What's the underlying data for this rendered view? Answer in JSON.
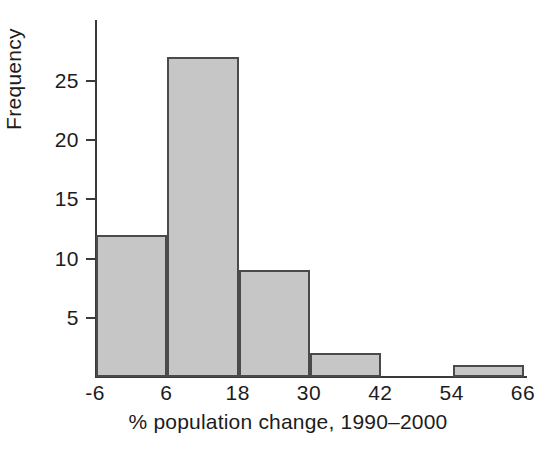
{
  "chart_data": {
    "type": "bar",
    "title": "",
    "subtitle": "",
    "xlabel": "% population change, 1990–2000",
    "ylabel": "Frequency",
    "grid": false,
    "legend": null,
    "xlim": [
      -6,
      66
    ],
    "ylim": [
      0,
      28
    ],
    "bin_width": 12,
    "x_tick_labels": [
      "-6",
      "6",
      "18",
      "30",
      "42",
      "54",
      "66"
    ],
    "x_tick_values": [
      -6,
      6,
      18,
      30,
      42,
      54,
      66
    ],
    "y_tick_labels": [
      "5",
      "10",
      "15",
      "20",
      "25"
    ],
    "y_tick_values": [
      5,
      10,
      15,
      20,
      25
    ],
    "categories": [
      "-6 to 6",
      "6 to 18",
      "18 to 30",
      "30 to 42",
      "42 to 54",
      "54 to 66"
    ],
    "bin_edges": [
      -6,
      6,
      18,
      30,
      42,
      54,
      66
    ],
    "values": [
      12,
      27,
      9,
      2,
      0,
      1
    ],
    "bar_fill_color": "#c6c6c6",
    "bar_edge_color": "#4a4a4a",
    "axis_color": "#3a3a3a",
    "text_color": "#1c1c1c",
    "background_color": "#ffffff"
  },
  "bars": [
    {
      "label": "-6 to 6",
      "value": 12,
      "x0": -6,
      "x1": 6
    },
    {
      "label": "6 to 18",
      "value": 27,
      "x0": 6,
      "x1": 18
    },
    {
      "label": "18 to 30",
      "value": 9,
      "x0": 18,
      "x1": 30
    },
    {
      "label": "30 to 42",
      "value": 2,
      "x0": 30,
      "x1": 42
    },
    {
      "label": "42 to 54",
      "value": 0,
      "x0": 42,
      "x1": 54
    },
    {
      "label": "54 to 66",
      "value": 1,
      "x0": 54,
      "x1": 66
    }
  ],
  "axes": {
    "y_title": "Frequency",
    "x_title": "% population change, 1990–2000",
    "y_ticks": [
      {
        "label": "5",
        "value": 5
      },
      {
        "label": "10",
        "value": 10
      },
      {
        "label": "15",
        "value": 15
      },
      {
        "label": "20",
        "value": 20
      },
      {
        "label": "25",
        "value": 25
      }
    ],
    "x_ticks": [
      {
        "label": "-6",
        "value": -6
      },
      {
        "label": "6",
        "value": 6
      },
      {
        "label": "18",
        "value": 18
      },
      {
        "label": "30",
        "value": 30
      },
      {
        "label": "42",
        "value": 42
      },
      {
        "label": "54",
        "value": 54
      },
      {
        "label": "66",
        "value": 66
      }
    ]
  }
}
